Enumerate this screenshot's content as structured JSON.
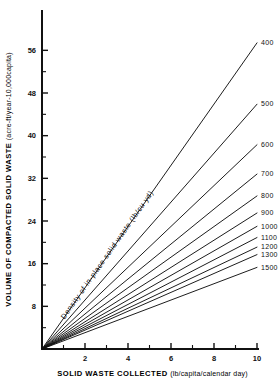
{
  "chart_data": {
    "type": "line",
    "title": "",
    "xlabel": "SOLID WASTE COLLECTED",
    "xlabel_units": "(lb/capita/calendar day)",
    "ylabel": "VOLUME OF COMPACTED SOLID WASTE",
    "ylabel_units": "(acre-ft/year-10,000capita)",
    "annotation": "Density of in-place solid waste (lb/cu yd)",
    "xlim": [
      0,
      10
    ],
    "ylim": [
      0,
      60
    ],
    "xticks": [
      2,
      4,
      6,
      8,
      10
    ],
    "xticks_minor": [
      1,
      3,
      5,
      7,
      9
    ],
    "yticks": [
      8,
      16,
      24,
      32,
      40,
      48,
      56
    ],
    "yticks_minor": [
      4,
      12,
      20,
      28,
      36,
      44,
      52
    ],
    "grid": false,
    "legend_position": "right-inline",
    "line_color": "#111111",
    "x": [
      0,
      10
    ],
    "series": [
      {
        "name": "400",
        "label": "400",
        "values": [
          0,
          57.4
        ]
      },
      {
        "name": "500",
        "label": "500",
        "values": [
          0,
          45.9
        ]
      },
      {
        "name": "600",
        "label": "600",
        "values": [
          0,
          38.3
        ]
      },
      {
        "name": "700",
        "label": "700",
        "values": [
          0,
          32.8
        ]
      },
      {
        "name": "800",
        "label": "800",
        "values": [
          0,
          28.7
        ]
      },
      {
        "name": "900",
        "label": "900",
        "values": [
          0,
          25.5
        ]
      },
      {
        "name": "1000",
        "label": "1000",
        "values": [
          0,
          23.0
        ]
      },
      {
        "name": "1100",
        "label": "1100",
        "values": [
          0,
          20.9
        ]
      },
      {
        "name": "1200",
        "label": "1200",
        "values": [
          0,
          19.1
        ]
      },
      {
        "name": "1300",
        "label": "1300",
        "values": [
          0,
          17.7
        ]
      },
      {
        "name": "1500",
        "label": "1500",
        "values": [
          0,
          15.3
        ]
      }
    ]
  }
}
